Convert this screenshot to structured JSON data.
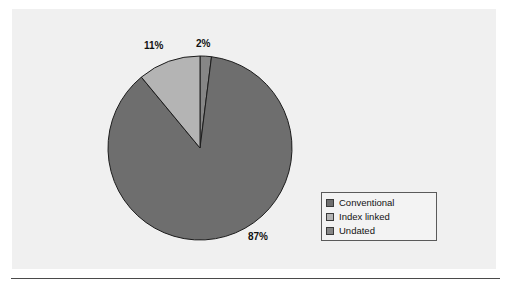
{
  "figure": {
    "panel_color": "#f0f0f0",
    "page_background": "#ffffff",
    "rule_color": "#4a4a4a"
  },
  "labels": {
    "pct_undated": "2%",
    "pct_index_linked": "11%",
    "pct_conventional": "87%"
  },
  "legend": {
    "items": [
      {
        "label": "Conventional",
        "color": "#6e6e6e"
      },
      {
        "label": "Index linked",
        "color": "#b4b4b4"
      },
      {
        "label": "Undated",
        "color": "#868686"
      }
    ]
  },
  "chart_data": {
    "type": "pie",
    "title": "",
    "categories": [
      "Conventional",
      "Index linked",
      "Undated"
    ],
    "values": [
      87,
      11,
      2
    ],
    "value_labels": [
      "87%",
      "11%",
      "2%"
    ],
    "units": "percent",
    "colors": [
      "#6e6e6e",
      "#b4b4b4",
      "#868686"
    ],
    "legend_position": "right",
    "start_angle_deg": 0,
    "direction": "clockwise",
    "slice_order_clockwise_from_top": [
      "Undated",
      "Conventional",
      "Index linked"
    ],
    "geometry": {
      "cx": 200,
      "cy": 148,
      "r": 92
    },
    "grid": false
  }
}
